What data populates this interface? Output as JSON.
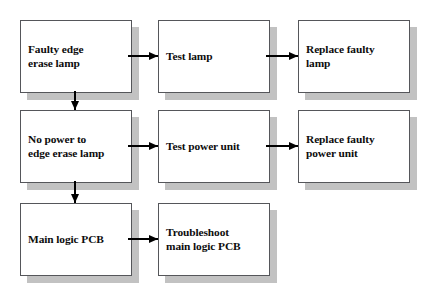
{
  "diagram": {
    "colors": {
      "box_fill": "#ffffff",
      "box_border": "#55565a",
      "box_shadow": "#c2c2c2",
      "arrow": "#000000",
      "text": "#0d0d0d",
      "background": "#ffffff"
    },
    "nodes": [
      {
        "id": "faulty-edge-erase-lamp",
        "label": "Faulty edge\nerase lamp",
        "row": 1,
        "column": 1
      },
      {
        "id": "test-lamp",
        "label": "Test lamp",
        "row": 1,
        "column": 2
      },
      {
        "id": "replace-faulty-lamp",
        "label": "Replace faulty\nlamp",
        "row": 1,
        "column": 3
      },
      {
        "id": "no-power-to-edge-erase-lamp",
        "label": "No power to\nedge erase lamp",
        "row": 2,
        "column": 1
      },
      {
        "id": "test-power-unit",
        "label": "Test power unit",
        "row": 2,
        "column": 2
      },
      {
        "id": "replace-faulty-power-unit",
        "label": "Replace faulty\npower unit",
        "row": 2,
        "column": 3
      },
      {
        "id": "main-logic-pcb",
        "label": "Main logic PCB",
        "row": 3,
        "column": 1
      },
      {
        "id": "troubleshoot-main-logic-pcb",
        "label": "Troubleshoot\nmain logic PCB",
        "row": 3,
        "column": 2
      }
    ],
    "connectors": [
      {
        "id": "faulty-edge-erase-lamp-to-test-lamp",
        "from": "faulty-edge-erase-lamp",
        "to": "test-lamp",
        "direction": "right"
      },
      {
        "id": "test-lamp-to-replace-faulty-lamp",
        "from": "test-lamp",
        "to": "replace-faulty-lamp",
        "direction": "right"
      },
      {
        "id": "faulty-edge-erase-lamp-to-no-power",
        "from": "faulty-edge-erase-lamp",
        "to": "no-power-to-edge-erase-lamp",
        "direction": "down"
      },
      {
        "id": "no-power-to-test-power-unit",
        "from": "no-power-to-edge-erase-lamp",
        "to": "test-power-unit",
        "direction": "right"
      },
      {
        "id": "test-power-unit-to-replace-faulty-power-unit",
        "from": "test-power-unit",
        "to": "replace-faulty-power-unit",
        "direction": "right"
      },
      {
        "id": "no-power-to-main-logic-pcb",
        "from": "no-power-to-edge-erase-lamp",
        "to": "main-logic-pcb",
        "direction": "down"
      },
      {
        "id": "main-logic-pcb-to-troubleshoot",
        "from": "main-logic-pcb",
        "to": "troubleshoot-main-logic-pcb",
        "direction": "right"
      }
    ]
  }
}
